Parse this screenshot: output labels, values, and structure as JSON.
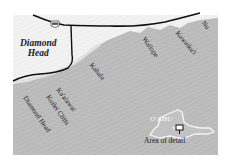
{
  "map": {
    "colors": {
      "ocean": "#b9b9b9",
      "land": "#f2f2f2",
      "road": "#111111",
      "island": "#c4c4c4"
    },
    "labels": {
      "diamond_head_area": "Diamond Head",
      "diamond_head_line1": "Diamond",
      "diamond_head_line2": "Head",
      "nu": "Nu",
      "kawaiku": "Kawaiku'i",
      "wailupe": "Wailupe",
      "kahala": "Kahala",
      "kaalawai": "Ka'alawai",
      "kuilei_cliffs": "Kuilei Cliffs",
      "diamond_head_beach": "Diamond Head",
      "oahu": "O'AHU",
      "area_of_detail": "Area of detail"
    },
    "highway_shield": "72"
  }
}
